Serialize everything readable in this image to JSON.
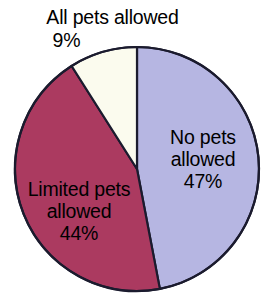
{
  "chart_data": {
    "type": "pie",
    "title": "",
    "subtitle": "",
    "xlabel": "",
    "ylabel": "",
    "grid": false,
    "legend_position": "none",
    "label_format": "name + percent",
    "start_angle_deg": 0,
    "direction": "clockwise",
    "categories": [
      "No pets allowed",
      "Limited pets allowed",
      "All pets allowed"
    ],
    "values": [
      47,
      44,
      9
    ],
    "units": "percent",
    "slices": [
      {
        "name": "No pets allowed",
        "value": 47,
        "value_label": "47%",
        "color": "#b6b6e2",
        "label_placement": "inside-right",
        "label_line_1": "No pets",
        "label_line_2": "allowed"
      },
      {
        "name": "Limited pets allowed",
        "value": 44,
        "value_label": "44%",
        "color": "#ab3a60",
        "label_placement": "inside-left",
        "label_line_1": "Limited pets",
        "label_line_2": "allowed"
      },
      {
        "name": "All pets allowed",
        "value": 9,
        "value_label": "9%",
        "color": "#fbfbee",
        "label_placement": "outside-top",
        "label_line_1": "All pets allowed",
        "label_line_2": ""
      }
    ]
  },
  "colors": {
    "background": "#ffffff",
    "outline": "#1b1b2e",
    "text": "#000000",
    "slice_no_pets": "#b6b6e2",
    "slice_limited_pets": "#ab3a60",
    "slice_all_pets": "#fbfbee"
  },
  "labels": {
    "all_pets": {
      "name": "All pets allowed",
      "value": "9%"
    },
    "no_pets": {
      "name_line_1": "No pets",
      "name_line_2": "allowed",
      "value": "47%"
    },
    "limited_pets": {
      "name_line_1": "Limited pets",
      "name_line_2": "allowed",
      "value": "44%"
    }
  }
}
